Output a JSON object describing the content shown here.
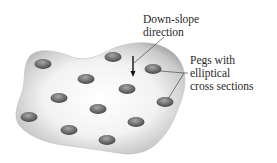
{
  "diagram": {
    "labels": {
      "downslope_line1": "Down-slope",
      "downslope_line2": "direction",
      "pegs_line1": "Pegs with",
      "pegs_line2": "elliptical",
      "pegs_line3": "cross sections"
    },
    "colors": {
      "surface_light": "#f7f7f7",
      "surface_edge": "#9a9a9a",
      "peg_dark": "#4a4a4a",
      "peg_light": "#a0a0a0",
      "text": "#2a2a2a",
      "leader_line": "#333333"
    },
    "pegs": [
      {
        "x": 43,
        "y": 64
      },
      {
        "x": 113,
        "y": 57
      },
      {
        "x": 153,
        "y": 69
      },
      {
        "x": 86,
        "y": 79
      },
      {
        "x": 127,
        "y": 89
      },
      {
        "x": 59,
        "y": 98
      },
      {
        "x": 165,
        "y": 102
      },
      {
        "x": 98,
        "y": 109
      },
      {
        "x": 29,
        "y": 117
      },
      {
        "x": 136,
        "y": 122
      },
      {
        "x": 69,
        "y": 130
      },
      {
        "x": 107,
        "y": 140
      }
    ]
  }
}
